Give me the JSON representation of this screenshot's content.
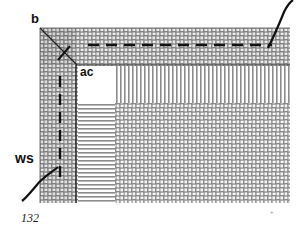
{
  "figure": {
    "labels": {
      "b": "b",
      "ac": "ac",
      "ws": "ws"
    },
    "caption_number": "132",
    "colors": {
      "line": "#111111",
      "weave_dark": "#7a7a7a",
      "weave_light": "#ffffff",
      "background": "#ffffff"
    }
  }
}
